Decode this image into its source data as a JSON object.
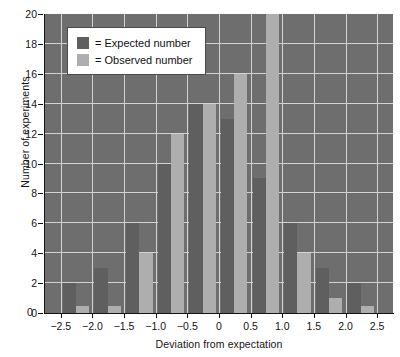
{
  "chart_data": {
    "type": "bar",
    "title": "",
    "xlabel": "Deviation from expectation",
    "ylabel": "Number of experiments",
    "xlim": [
      -2.75,
      2.75
    ],
    "ylim": [
      0,
      20
    ],
    "ytick_values": [
      0,
      2,
      4,
      6,
      8,
      10,
      12,
      14,
      16,
      18,
      20
    ],
    "ytick_labels": [
      "0",
      "2",
      "4",
      "6",
      "8",
      "10",
      "12",
      "14",
      "16",
      "18",
      "20"
    ],
    "xtick_values": [
      -2.5,
      -2.0,
      -1.5,
      -1.0,
      -0.5,
      0,
      0.5,
      1.0,
      1.5,
      2.0,
      2.5
    ],
    "xtick_labels": [
      "−2.5",
      "−2.0",
      "−1.5",
      "−1.0",
      "−0.5",
      "0",
      "0.5",
      "1.0",
      "1.5",
      "2.0",
      "2.5"
    ],
    "origin_label": "0",
    "grid": true,
    "legend_position": "upper-left",
    "plot_background": "#6e6e6e",
    "grid_color": "#d2d2d2",
    "bin_centers": [
      -2.25,
      -1.75,
      -1.25,
      -0.75,
      -0.25,
      0.25,
      0.75,
      1.25,
      1.75,
      2.25
    ],
    "series": [
      {
        "name": "Expected number",
        "color": "#5f5f5f",
        "values": [
          2,
          3,
          6,
          10,
          14,
          13,
          9,
          6,
          3,
          2
        ]
      },
      {
        "name": "Observed number",
        "color": "#aeaeae",
        "values": [
          0.5,
          0.5,
          4,
          12,
          14,
          16,
          20,
          4,
          1,
          0.5
        ]
      }
    ]
  },
  "legend": {
    "items": [
      {
        "label": "= Expected number",
        "swatch": "exp"
      },
      {
        "label": "= Observed number",
        "swatch": "obs"
      }
    ]
  }
}
